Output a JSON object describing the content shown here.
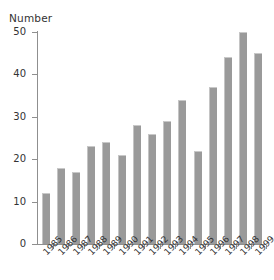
{
  "chart_data": {
    "type": "bar",
    "title": "",
    "subtitle": "",
    "xlabel": "",
    "ylabel": "Number",
    "categories": [
      "1985",
      "1986",
      "1987",
      "1988",
      "1989",
      "1990",
      "1991",
      "1992",
      "1993",
      "1994",
      "1995",
      "1996",
      "1997",
      "1998",
      "1999"
    ],
    "values": [
      12,
      18,
      17,
      23,
      24,
      21,
      28,
      26,
      29,
      34,
      22,
      37,
      44,
      50,
      45
    ],
    "ylim": [
      0,
      50
    ],
    "yticks": [
      0,
      10,
      20,
      30,
      40,
      50
    ],
    "ytick_labels": [
      "0",
      "10",
      "20",
      "30",
      "40",
      "50"
    ],
    "grid": false,
    "legend": null,
    "legend_position": "none",
    "annotations": [],
    "bar_color": "#9a9a9a",
    "axis_color": "#8f8f8f",
    "text_color": "#333333",
    "background_color": "#ffffff",
    "xtick_rotation": -45
  }
}
